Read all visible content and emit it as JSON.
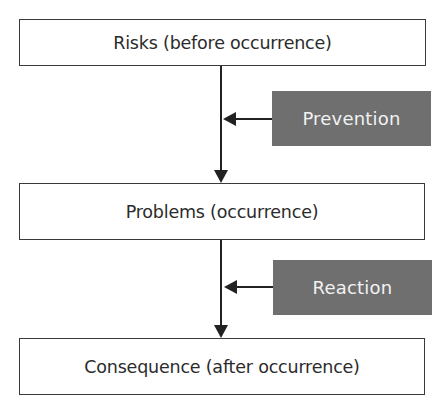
{
  "diagram": {
    "type": "flowchart",
    "stages": [
      {
        "label": "Risks (before occurrence)"
      },
      {
        "label": "Problems (occurrence)"
      },
      {
        "label": "Consequence (after occurrence)"
      }
    ],
    "actions": [
      {
        "label": "Prevention",
        "targets": "arrow between Risks and Problems"
      },
      {
        "label": "Reaction",
        "targets": "arrow between Problems and Consequence"
      }
    ],
    "colors": {
      "stage_border": "#3a3a3a",
      "stage_text": "#2b2b2b",
      "action_fill": "#6f6f6f",
      "action_text": "#f2f2f2",
      "connector": "#222222"
    }
  }
}
